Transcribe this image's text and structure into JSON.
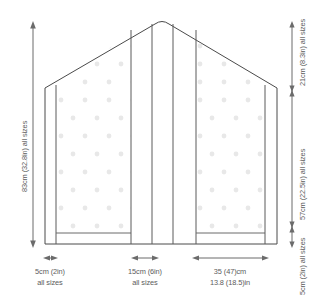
{
  "diagram": {
    "colors": {
      "outline": "#4a4a4a",
      "panel_line": "#5a5a5a",
      "dot": "#e8e8e8",
      "dimension_line": "#6b6b6b",
      "text": "#5c5c5c",
      "background": "#ffffff"
    },
    "dimensions": {
      "left_total": {
        "label_line1": "83cm (32.8in) all sizes",
        "orientation": "vertical",
        "position": "left"
      },
      "right_top": {
        "label_line1": "21cm (8.3in) all sizes",
        "orientation": "vertical",
        "position": "right"
      },
      "right_middle": {
        "label_line1": "57cm (22.5in) all sizes",
        "orientation": "vertical",
        "position": "right"
      },
      "right_bottom": {
        "label_line1": "5cm (2in) all sizes",
        "orientation": "vertical",
        "position": "right"
      },
      "bottom_left": {
        "label_line1": "5cm (2in)",
        "label_line2": "all sizes",
        "orientation": "horizontal",
        "position": "bottom-left"
      },
      "bottom_center": {
        "label_line1": "15cm (6in)",
        "label_line2": "all sizes",
        "orientation": "horizontal",
        "position": "bottom-center"
      },
      "bottom_right": {
        "label_line1": "35 (47)cm",
        "label_line2": "13.8 (18.5)in",
        "orientation": "horizontal",
        "position": "bottom-right"
      }
    }
  }
}
